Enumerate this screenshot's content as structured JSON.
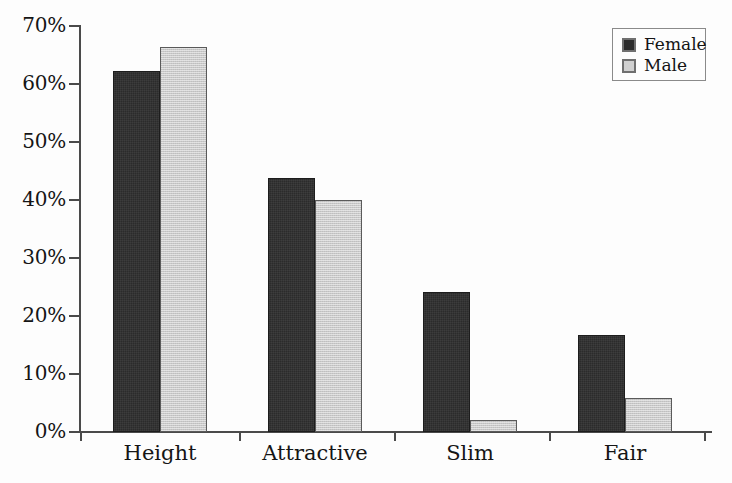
{
  "chart_data": {
    "type": "bar",
    "title": "",
    "subtitle": "",
    "xlabel": "",
    "ylabel": "",
    "categories": [
      "Height",
      "Attractive",
      "Slim",
      "Fair"
    ],
    "series": [
      {
        "name": "Female",
        "color": "#2b2b2b",
        "values": [
          62.2,
          43.8,
          24.1,
          16.7
        ]
      },
      {
        "name": "Male",
        "color": "#c9c9c9",
        "values": [
          66.4,
          40.0,
          2.1,
          5.9
        ]
      }
    ],
    "ylim": [
      0,
      70
    ],
    "ytick_values": [
      0,
      10,
      20,
      30,
      40,
      50,
      60,
      70
    ],
    "ytick_labels": [
      "0%",
      "10%",
      "20%",
      "30%",
      "40%",
      "50%",
      "60%",
      "70%"
    ],
    "grid": false,
    "legend_position": "top-right",
    "value_format": "percent",
    "annotations": []
  },
  "legend": {
    "entries": [
      {
        "label": "Female",
        "swatch": "legend-swatch-female"
      },
      {
        "label": "Male",
        "swatch": "legend-swatch-male"
      }
    ]
  },
  "colors": {
    "female": "#2b2b2b",
    "male": "#c9c9c9",
    "axis": "#4a4a4a",
    "text": "#151515",
    "background": "#fdfdfd",
    "legend_border": "#8a8a8a"
  }
}
